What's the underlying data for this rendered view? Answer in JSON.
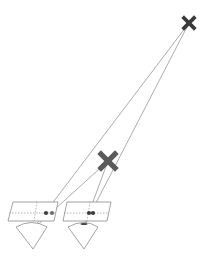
{
  "diagram": {
    "type": "stereo-parallax-illustration",
    "colors": {
      "far_marker": "#3a3a3a",
      "near_marker": "#5a5a5a",
      "ray": "#8a8a8a",
      "outline": "#8c8c8c",
      "dot_dark": "#3c3c3c",
      "dot_light": "#6e6e6e"
    },
    "objects": [
      {
        "id": "far-point",
        "shape": "x-marker",
        "x": 189,
        "y": 23,
        "size": 5
      },
      {
        "id": "near-point",
        "shape": "x-marker",
        "x": 108,
        "y": 161,
        "size": 7
      }
    ],
    "image_planes": [
      {
        "id": "left-plane",
        "corners": [
          [
            13,
            202
          ],
          [
            58,
            202
          ],
          [
            54,
            221
          ],
          [
            8,
            221
          ]
        ],
        "h_mid": 213,
        "v_mid_top": [
          37,
          202
        ],
        "v_mid_bottom": [
          34,
          221
        ],
        "dots": [
          {
            "x": 46,
            "y": 213,
            "tone": "dark"
          },
          {
            "x": 52,
            "y": 213,
            "tone": "light"
          }
        ]
      },
      {
        "id": "right-plane",
        "corners": [
          [
            67,
            202
          ],
          [
            111,
            202
          ],
          [
            107,
            221
          ],
          [
            63,
            221
          ]
        ],
        "h_mid": 213,
        "v_mid_top": [
          90,
          202
        ],
        "v_mid_bottom": [
          87,
          221
        ],
        "dots": [
          {
            "x": 89,
            "y": 213,
            "tone": "dark"
          },
          {
            "x": 93,
            "y": 213,
            "tone": "dark"
          }
        ]
      }
    ],
    "eyes": [
      {
        "id": "left-eye",
        "arc_left": [
          16,
          227
        ],
        "arc_top": [
          32,
          222
        ],
        "arc_right": [
          47,
          227
        ],
        "vertex": [
          33,
          249
        ]
      },
      {
        "id": "right-eye",
        "arc_left": [
          68,
          227
        ],
        "arc_top": [
          84,
          222
        ],
        "arc_right": [
          98,
          227
        ],
        "vertex": [
          84,
          249
        ],
        "pupil": true
      }
    ],
    "rays": [
      {
        "from": [
          189,
          23
        ],
        "to": [
          32,
          230
        ]
      },
      {
        "from": [
          189,
          23
        ],
        "to": [
          84,
          226
        ]
      },
      {
        "from": [
          108,
          161
        ],
        "to": [
          32,
          230
        ]
      },
      {
        "from": [
          108,
          161
        ],
        "to": [
          84,
          226
        ]
      }
    ]
  }
}
